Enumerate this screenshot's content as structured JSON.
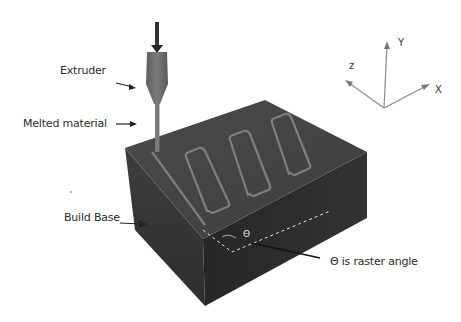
{
  "diagram": {
    "labels": {
      "extruder": "Extruder",
      "melted_material": "Melted material",
      "build_base": "Build Base",
      "raster_angle": "Θ is raster angle",
      "theta_symbol": "Θ"
    },
    "axes": {
      "x": "X",
      "y": "Y",
      "z": "z"
    },
    "colors": {
      "block_top": "#474747",
      "block_left": "#3a3a3a",
      "block_front": "#2a2a2a",
      "raster_path": "#7a7a7a",
      "extruder": "#6e6e6e",
      "dashed_line": "#e0e0e0",
      "text": "#2b2b2b"
    }
  }
}
